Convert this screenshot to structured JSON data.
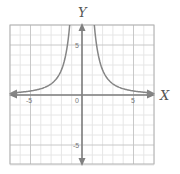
{
  "chart_data": {
    "type": "line",
    "title": "",
    "function": "y = 10/x^2",
    "xlabel": "X",
    "ylabel": "Y",
    "xlim": [
      -7,
      7
    ],
    "ylim": [
      -7,
      7
    ],
    "grid": true,
    "major_grid_step": 5,
    "minor_grid_step": 1,
    "x_tick_labels": [
      {
        "value": -5,
        "label": "-5"
      },
      {
        "value": 0,
        "label": "0"
      },
      {
        "value": 5,
        "label": "5"
      }
    ],
    "y_tick_labels": [
      {
        "value": 5,
        "label": "5"
      },
      {
        "value": -5,
        "label": "-5"
      }
    ],
    "series": [
      {
        "name": "left-branch",
        "x": [
          -7,
          -6,
          -5,
          -4,
          -3,
          -2,
          -1.5,
          -1.2
        ],
        "y": [
          0.2,
          0.28,
          0.4,
          0.63,
          1.11,
          2.5,
          4.44,
          6.94
        ]
      },
      {
        "name": "right-branch",
        "x": [
          1.2,
          1.5,
          2,
          3,
          4,
          5,
          6,
          7
        ],
        "y": [
          6.94,
          4.44,
          2.5,
          1.11,
          0.63,
          0.4,
          0.28,
          0.2
        ]
      }
    ],
    "legend": null
  },
  "labels": {
    "x_axis": "X",
    "y_axis": "Y",
    "origin": "0",
    "x_neg5": "-5",
    "x_pos5": "5",
    "y_pos5": "5",
    "y_neg5": "-5"
  },
  "colors": {
    "axis": "#808080",
    "curve": "#858585",
    "grid_minor": "#e6e6e6",
    "grid_major": "#c8c8c8",
    "border": "#b0b0b0"
  }
}
